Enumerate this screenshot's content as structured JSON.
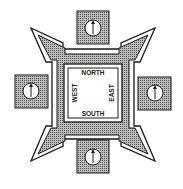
{
  "diagram": {
    "type": "compass-fortress-plan",
    "labels": {
      "north": "NORTH",
      "south": "SOUTH",
      "east": "EAST",
      "west": "WEST"
    },
    "compass_panels": [
      {
        "position": "top",
        "icon": "arrow-up-icon"
      },
      {
        "position": "left",
        "icon": "arrow-up-icon"
      },
      {
        "position": "right",
        "icon": "arrow-up-icon"
      },
      {
        "position": "bottom",
        "icon": "arrow-up-icon"
      }
    ],
    "colors": {
      "ink": "#1a1a1a",
      "hatch": "#8a8a8a",
      "paper": "#ffffff"
    }
  }
}
